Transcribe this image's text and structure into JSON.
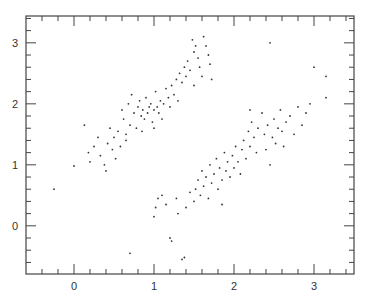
{
  "chart_data": {
    "type": "scatter",
    "title": "",
    "xlabel": "",
    "ylabel": "",
    "xlim": [
      -0.6,
      3.5
    ],
    "ylim": [
      -0.79,
      3.44
    ],
    "grid": false,
    "legend": null,
    "x_ticks": [
      0,
      1,
      2,
      3
    ],
    "y_ticks": [
      0,
      1,
      2,
      3
    ],
    "x_minor_step": 0.2,
    "y_minor_step": 0.2,
    "colors": {
      "axis": "#444444",
      "point": "#333333",
      "background": "#ffffff"
    },
    "series": [
      {
        "name": "upper-cluster",
        "points": [
          [
            -0.25,
            0.6
          ],
          [
            0.0,
            0.98
          ],
          [
            0.13,
            1.65
          ],
          [
            0.18,
            1.2
          ],
          [
            0.2,
            1.05
          ],
          [
            0.25,
            1.3
          ],
          [
            0.3,
            1.45
          ],
          [
            0.33,
            1.15
          ],
          [
            0.38,
            1.0
          ],
          [
            0.42,
            1.35
          ],
          [
            0.45,
            1.6
          ],
          [
            0.48,
            1.25
          ],
          [
            0.5,
            1.45
          ],
          [
            0.52,
            1.1
          ],
          [
            0.55,
            1.55
          ],
          [
            0.58,
            1.3
          ],
          [
            0.6,
            1.9
          ],
          [
            0.62,
            1.75
          ],
          [
            0.65,
            1.5
          ],
          [
            0.68,
            2.0
          ],
          [
            0.7,
            1.65
          ],
          [
            0.72,
            2.15
          ],
          [
            0.75,
            1.85
          ],
          [
            0.78,
            1.6
          ],
          [
            0.8,
            1.95
          ],
          [
            0.82,
            2.05
          ],
          [
            0.84,
            1.8
          ],
          [
            0.86,
            1.9
          ],
          [
            0.88,
            1.75
          ],
          [
            0.9,
            2.1
          ],
          [
            0.92,
            1.85
          ],
          [
            0.94,
            1.95
          ],
          [
            0.96,
            2.0
          ],
          [
            0.98,
            1.7
          ],
          [
            1.0,
            1.9
          ],
          [
            1.02,
            2.2
          ],
          [
            1.04,
            1.95
          ],
          [
            1.06,
            1.85
          ],
          [
            1.08,
            2.05
          ],
          [
            1.1,
            1.75
          ],
          [
            1.12,
            2.0
          ],
          [
            1.15,
            2.25
          ],
          [
            1.18,
            2.1
          ],
          [
            1.2,
            1.95
          ],
          [
            1.22,
            2.3
          ],
          [
            1.25,
            2.15
          ],
          [
            1.28,
            2.4
          ],
          [
            1.3,
            2.05
          ],
          [
            1.32,
            2.5
          ],
          [
            1.35,
            2.35
          ],
          [
            1.38,
            2.6
          ],
          [
            1.4,
            2.45
          ],
          [
            1.42,
            2.7
          ],
          [
            1.45,
            2.55
          ],
          [
            1.48,
            3.05
          ],
          [
            1.5,
            2.85
          ],
          [
            1.52,
            2.95
          ],
          [
            1.55,
            2.75
          ],
          [
            1.57,
            2.6
          ],
          [
            1.6,
            2.45
          ],
          [
            1.62,
            3.1
          ],
          [
            1.65,
            2.95
          ],
          [
            1.68,
            2.8
          ],
          [
            1.7,
            2.65
          ],
          [
            1.72,
            2.4
          ],
          [
            1.5,
            2.3
          ],
          [
            0.65,
            1.4
          ],
          [
            0.85,
            1.55
          ],
          [
            1.0,
            1.6
          ],
          [
            0.4,
            0.9
          ]
        ]
      },
      {
        "name": "lower-cluster",
        "points": [
          [
            0.7,
            -0.45
          ],
          [
            1.0,
            0.15
          ],
          [
            1.02,
            0.3
          ],
          [
            1.05,
            0.45
          ],
          [
            1.1,
            0.5
          ],
          [
            1.15,
            0.35
          ],
          [
            1.2,
            -0.2
          ],
          [
            1.22,
            -0.25
          ],
          [
            1.28,
            0.45
          ],
          [
            1.35,
            -0.55
          ],
          [
            1.38,
            -0.52
          ],
          [
            1.4,
            0.3
          ],
          [
            1.45,
            0.55
          ],
          [
            1.5,
            0.4
          ],
          [
            1.52,
            0.6
          ],
          [
            1.55,
            0.75
          ],
          [
            1.58,
            0.5
          ],
          [
            1.6,
            0.9
          ],
          [
            1.62,
            0.65
          ],
          [
            1.65,
            0.8
          ],
          [
            1.68,
            0.45
          ],
          [
            1.7,
            1.0
          ],
          [
            1.72,
            0.7
          ],
          [
            1.75,
            0.85
          ],
          [
            1.78,
            1.1
          ],
          [
            1.8,
            0.6
          ],
          [
            1.82,
            0.95
          ],
          [
            1.85,
            0.75
          ],
          [
            1.88,
            1.2
          ],
          [
            1.9,
            0.9
          ],
          [
            1.92,
            1.05
          ],
          [
            1.95,
            0.8
          ],
          [
            1.98,
            1.15
          ],
          [
            2.0,
            0.95
          ],
          [
            2.02,
            1.3
          ],
          [
            2.05,
            1.05
          ],
          [
            2.08,
            0.85
          ],
          [
            2.1,
            1.25
          ],
          [
            2.12,
            1.4
          ],
          [
            2.15,
            1.1
          ],
          [
            2.18,
            1.55
          ],
          [
            2.2,
            1.3
          ],
          [
            2.22,
            1.7
          ],
          [
            2.25,
            1.45
          ],
          [
            2.28,
            1.2
          ],
          [
            2.3,
            1.6
          ],
          [
            2.35,
            1.85
          ],
          [
            2.38,
            1.5
          ],
          [
            2.4,
            1.25
          ],
          [
            2.42,
            1.65
          ],
          [
            2.45,
            1.0
          ],
          [
            2.48,
            1.45
          ],
          [
            2.5,
            1.75
          ],
          [
            2.52,
            1.35
          ],
          [
            2.55,
            1.6
          ],
          [
            2.58,
            1.9
          ],
          [
            2.6,
            1.55
          ],
          [
            2.62,
            1.3
          ],
          [
            2.65,
            1.7
          ],
          [
            2.7,
            1.8
          ],
          [
            2.75,
            1.5
          ],
          [
            2.8,
            1.95
          ],
          [
            2.85,
            1.65
          ],
          [
            2.9,
            1.85
          ],
          [
            2.95,
            2.0
          ],
          [
            3.0,
            2.6
          ],
          [
            3.15,
            2.45
          ],
          [
            3.15,
            2.1
          ],
          [
            2.45,
            3.0
          ],
          [
            2.2,
            1.9
          ],
          [
            1.3,
            0.2
          ],
          [
            1.85,
            0.35
          ]
        ]
      }
    ]
  }
}
